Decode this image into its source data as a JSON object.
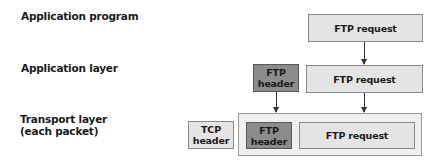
{
  "layers": {
    "application_program": "Application program",
    "application_layer": "Application layer",
    "transport_layer": "Transport layer\n(each packet)"
  },
  "boxes": {
    "ftp_request_program": "FTP request",
    "ftp_request_app": "FTP request",
    "ftp_header_app": "FTP\nheader",
    "tcp_header": "TCP\nheader",
    "ftp_header_transport": "FTP\nheader",
    "ftp_request_transport": "FTP request"
  },
  "colors": {
    "light_box": "#e4e4e4",
    "dark_box": "#8c8c8c",
    "container": "#efefef"
  }
}
